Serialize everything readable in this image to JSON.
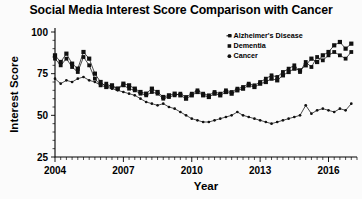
{
  "chart_data": {
    "type": "line",
    "title": "Social Media Interest Score Comparison with Cancer",
    "xlabel": "Year",
    "ylabel": "Interest Score",
    "xlim": [
      2004,
      2017.25
    ],
    "ylim": [
      25,
      100
    ],
    "yticks": [
      25,
      50,
      75,
      100
    ],
    "xticks": [
      2004,
      2007,
      2010,
      2013,
      2016
    ],
    "xtick_labels": [
      "2004",
      "2007",
      "2010",
      "2013",
      "2016"
    ],
    "ytick_labels": [
      "25",
      "50",
      "75",
      "100"
    ],
    "grid": false,
    "legend_position": "top-right",
    "x": [
      2004.0,
      2004.25,
      2004.5,
      2004.75,
      2005.0,
      2005.25,
      2005.5,
      2005.75,
      2006.0,
      2006.25,
      2006.5,
      2006.75,
      2007.0,
      2007.25,
      2007.5,
      2007.75,
      2008.0,
      2008.25,
      2008.5,
      2008.75,
      2009.0,
      2009.25,
      2009.5,
      2009.75,
      2010.0,
      2010.25,
      2010.5,
      2010.75,
      2011.0,
      2011.25,
      2011.5,
      2011.75,
      2012.0,
      2012.25,
      2012.5,
      2012.75,
      2013.0,
      2013.25,
      2013.5,
      2013.75,
      2014.0,
      2014.25,
      2014.5,
      2014.75,
      2015.0,
      2015.25,
      2015.5,
      2015.75,
      2016.0,
      2016.25,
      2016.5,
      2016.75,
      2017.0
    ],
    "series": [
      {
        "name": "Alzheimer's Disease",
        "marker": "dash",
        "values": [
          86,
          82,
          87,
          81,
          78,
          88,
          84,
          75,
          70,
          67,
          68,
          66,
          69,
          68,
          66,
          64,
          63,
          66,
          64,
          61,
          62,
          63,
          62,
          60,
          62,
          64,
          62,
          61,
          63,
          62,
          64,
          63,
          65,
          66,
          68,
          67,
          69,
          70,
          72,
          71,
          74,
          76,
          78,
          77,
          80,
          84,
          82,
          86,
          88,
          92,
          94,
          90,
          93
        ]
      },
      {
        "name": "Dementia",
        "marker": "square",
        "values": [
          84,
          80,
          84,
          79,
          76,
          85,
          80,
          72,
          68,
          69,
          67,
          66,
          68,
          66,
          65,
          63,
          62,
          64,
          63,
          60,
          61,
          62,
          63,
          61,
          63,
          65,
          63,
          62,
          64,
          63,
          65,
          64,
          66,
          67,
          69,
          68,
          70,
          72,
          74,
          73,
          76,
          78,
          80,
          76,
          82,
          79,
          85,
          83,
          86,
          88,
          86,
          84,
          88
        ]
      },
      {
        "name": "Cancer",
        "marker": "dot",
        "values": [
          72,
          69,
          71,
          70,
          72,
          73,
          71,
          70,
          68,
          67,
          66,
          65,
          64,
          63,
          62,
          60,
          58,
          57,
          56,
          57,
          55,
          54,
          52,
          50,
          48,
          47,
          46,
          46,
          47,
          48,
          49,
          50,
          52,
          50,
          49,
          48,
          47,
          46,
          45,
          46,
          47,
          48,
          49,
          50,
          56,
          51,
          53,
          54,
          53,
          52,
          54,
          53,
          57
        ]
      }
    ]
  },
  "legend": {
    "items": [
      {
        "label": "Alzheimer's Disease"
      },
      {
        "label": "Dementia"
      },
      {
        "label": "Cancer"
      }
    ]
  }
}
